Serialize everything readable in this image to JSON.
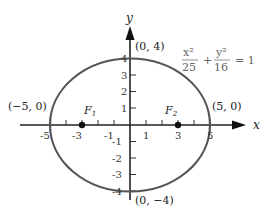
{
  "diagram": {
    "axes": {
      "x_label": "x",
      "y_label": "y",
      "x_ticks": [
        "-5",
        "-3",
        "-1",
        "1",
        "3",
        "5"
      ],
      "y_ticks": [
        "4",
        "3",
        "2",
        "1",
        "-1",
        "-2",
        "-3",
        "-4"
      ]
    },
    "vertices": {
      "top": "(0, 4)",
      "bottom": "(0, −4)",
      "left": "(−5, 0)",
      "right": "(5, 0)"
    },
    "foci": {
      "f1_label": "F",
      "f1_sub": "1",
      "f2_label": "F",
      "f2_sub": "2"
    },
    "equation": {
      "term1_num": "x²",
      "term1_den": "25",
      "plus": "+",
      "term2_num": "y²",
      "term2_den": "16",
      "equals": "= 1"
    },
    "ellipse": {
      "a": 5,
      "b": 4,
      "c": 3,
      "color": "#555555"
    }
  }
}
